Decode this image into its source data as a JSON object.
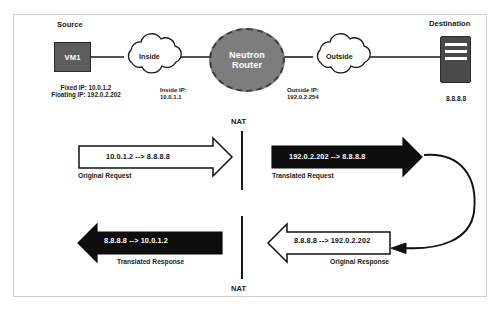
{
  "diagram": {
    "colors": {
      "vm_fill": "#5d5d5d",
      "server_fill": "#4a4a4a",
      "router_fill": "#7d7d7d",
      "stroke": "#1a1a1a",
      "frame": "#cfcfcf",
      "dark_arrow": "#0d0d0d",
      "light_arrow": "#ffffff"
    },
    "nodes": {
      "source": {
        "section_label": "Source",
        "box_label": "VM1",
        "fixed_ip": "Fixed IP: 10.0.1.2",
        "floating_ip": "Floating IP: 192.0.2.202"
      },
      "inside_cloud": {
        "label": "Inside"
      },
      "router": {
        "line1": "Neutron",
        "line2": "Router",
        "inside_ip_line1": "Inside IP:",
        "inside_ip_line2": "10.0.1.1",
        "outside_ip_line1": "Outside IP:",
        "outside_ip_line2": "192.0.2.254"
      },
      "outside_cloud": {
        "label": "Outside"
      },
      "destination": {
        "section_label": "Destination",
        "ip": "8.8.8.8"
      }
    },
    "nat_markers": {
      "top": "NAT",
      "bottom": "NAT"
    },
    "flows": [
      {
        "id": "original-request",
        "text": "10.0.1.2 --> 8.8.8.8",
        "caption": "Original Request",
        "direction": "right",
        "style": "outlined"
      },
      {
        "id": "translated-request",
        "text": "192.0.2.202 --> 8.8.8.8",
        "caption": "Translated Request",
        "direction": "right",
        "style": "filled"
      },
      {
        "id": "translated-response",
        "text": "8.8.8.8 --> 10.0.1.2",
        "caption": "Translated Response",
        "direction": "left",
        "style": "filled"
      },
      {
        "id": "original-response",
        "text": "8.8.8.8 --> 192.0.2.202",
        "caption": "Original Response",
        "direction": "left",
        "style": "outlined"
      }
    ]
  }
}
